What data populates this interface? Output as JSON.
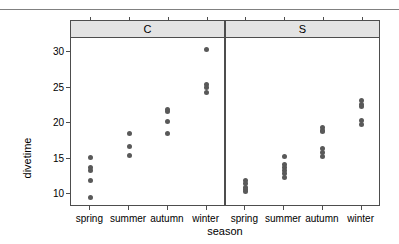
{
  "chart_data": {
    "type": "scatter",
    "title": "",
    "xlabel": "season",
    "ylabel": "divetime",
    "categories": [
      "spring",
      "summer",
      "autumn",
      "winter"
    ],
    "yticks": [
      10,
      15,
      20,
      25,
      30
    ],
    "ylim": [
      8.2,
      32.0
    ],
    "grid": false,
    "legend": null,
    "panel_variable": "site",
    "panels": [
      {
        "label": "C",
        "groups": [
          {
            "category": "spring",
            "values": [
              15.2,
              13.8,
              13.4,
              11.9,
              9.6
            ]
          },
          {
            "category": "summer",
            "values": [
              18.6,
              16.7,
              15.4
            ]
          },
          {
            "category": "autumn",
            "values": [
              21.9,
              21.7,
              20.2,
              18.6
            ]
          },
          {
            "category": "winter",
            "values": [
              30.4,
              25.4,
              25.0,
              24.3
            ]
          }
        ]
      },
      {
        "label": "S",
        "groups": [
          {
            "category": "spring",
            "values": [
              11.9,
              11.5,
              11.0,
              10.6,
              10.4
            ]
          },
          {
            "category": "summer",
            "values": [
              15.3,
              14.2,
              13.7,
              13.3,
              12.9,
              12.4
            ]
          },
          {
            "category": "autumn",
            "values": [
              19.4,
              19.0,
              18.8,
              16.4,
              15.9,
              15.3
            ]
          },
          {
            "category": "winter",
            "values": [
              23.2,
              22.7,
              22.4,
              20.4,
              19.8
            ]
          }
        ]
      }
    ],
    "colors": {
      "point": "#595959",
      "panel_border": "#4d4d4d",
      "strip_background": "#e3e3e3",
      "axis_text": "#000000",
      "top_rule": "#808080",
      "background": "#ffffff"
    }
  }
}
